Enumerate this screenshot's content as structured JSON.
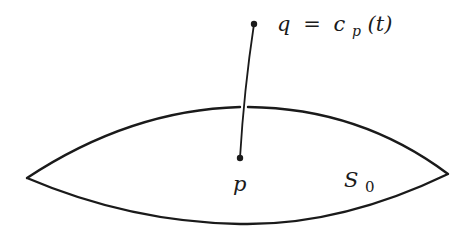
{
  "diagram": {
    "surface_label": "S",
    "surface_subscript": "0",
    "point_p_label": "p",
    "point_q_label": "q",
    "equals": "=",
    "curve_name": "c",
    "curve_subscript": "p",
    "curve_arg": "(t)",
    "colors": {
      "stroke": "#1a1a1a",
      "background": "#ffffff"
    }
  }
}
